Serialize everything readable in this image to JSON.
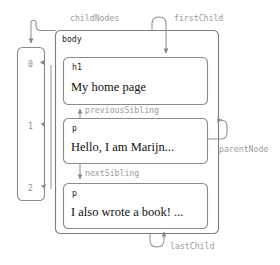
{
  "diagram": {
    "stroke_color": "#808080",
    "label_color": "#9b9b9b",
    "text_color": "#111111"
  },
  "body_node": {
    "tag": "body"
  },
  "child_nodes_array": {
    "indices": [
      "0",
      "1",
      "2"
    ]
  },
  "children": [
    {
      "tag": "h1",
      "text": "My home page"
    },
    {
      "tag": "p",
      "text": "Hello, I am Marijn..."
    },
    {
      "tag": "p",
      "text": "I also wrote a book! ..."
    }
  ],
  "relations": {
    "child_nodes": "childNodes",
    "first_child": "firstChild",
    "previous_sibling": "previousSibling",
    "next_sibling": "nextSibling",
    "parent_node": "parentNode",
    "last_child": "lastChild"
  }
}
